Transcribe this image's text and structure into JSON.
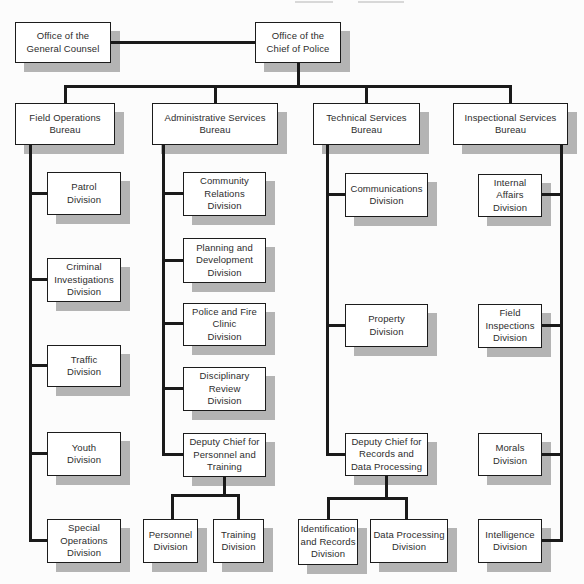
{
  "diagram": {
    "type": "org-chart",
    "colors": {
      "background": "#fcfcfc",
      "box_fill": "#ffffff",
      "box_border": "#1c1c1c",
      "box_shadow": "#b4b4b4",
      "connector_line": "#1a1a1a",
      "text": "#2d2d2d"
    },
    "nodes": [
      {
        "id": "general-counsel",
        "label": "Office of the\nGeneral Counsel",
        "x": 15,
        "y": 22,
        "w": 96,
        "h": 41
      },
      {
        "id": "chief-of-police",
        "label": "Office of the\nChief of Police",
        "x": 255,
        "y": 22,
        "w": 86,
        "h": 41
      },
      {
        "id": "field-operations-bureau",
        "label": "Field Operations\nBureau",
        "x": 15,
        "y": 103,
        "w": 100,
        "h": 42
      },
      {
        "id": "administrative-services-bureau",
        "label": "Administrative Services\nBureau",
        "x": 152,
        "y": 103,
        "w": 126,
        "h": 42
      },
      {
        "id": "technical-services-bureau",
        "label": "Technical Services\nBureau",
        "x": 313,
        "y": 103,
        "w": 107,
        "h": 42
      },
      {
        "id": "inspectional-services-bureau",
        "label": "Inspectional Services\nBureau",
        "x": 453,
        "y": 103,
        "w": 115,
        "h": 42
      },
      {
        "id": "patrol-division",
        "label": "Patrol\nDivision",
        "x": 47,
        "y": 172,
        "w": 74,
        "h": 43
      },
      {
        "id": "criminal-investigations-division",
        "label": "Criminal\nInvestigations\nDivision",
        "x": 47,
        "y": 258,
        "w": 74,
        "h": 44
      },
      {
        "id": "traffic-division",
        "label": "Traffic\nDivision",
        "x": 47,
        "y": 345,
        "w": 74,
        "h": 42
      },
      {
        "id": "youth-division",
        "label": "Youth\nDivision",
        "x": 47,
        "y": 432,
        "w": 74,
        "h": 44
      },
      {
        "id": "special-operations-division",
        "label": "Special\nOperations\nDivision",
        "x": 47,
        "y": 519,
        "w": 74,
        "h": 44
      },
      {
        "id": "community-relations-division",
        "label": "Community\nRelations\nDivision",
        "x": 183,
        "y": 172,
        "w": 83,
        "h": 44
      },
      {
        "id": "planning-development-division",
        "label": "Planning and\nDevelopment\nDivision",
        "x": 183,
        "y": 238,
        "w": 83,
        "h": 45
      },
      {
        "id": "police-fire-clinic-division",
        "label": "Police and Fire\nClinic\nDivision",
        "x": 183,
        "y": 303,
        "w": 83,
        "h": 43
      },
      {
        "id": "disciplinary-review-division",
        "label": "Disciplinary\nReview\nDivision",
        "x": 183,
        "y": 367,
        "w": 83,
        "h": 44
      },
      {
        "id": "deputy-chief-personnel-training",
        "label": "Deputy Chief for\nPersonnel and\nTraining",
        "x": 183,
        "y": 433,
        "w": 83,
        "h": 44
      },
      {
        "id": "personnel-division",
        "label": "Personnel\nDivision",
        "x": 143,
        "y": 519,
        "w": 55,
        "h": 44
      },
      {
        "id": "training-division",
        "label": "Training\nDivision",
        "x": 213,
        "y": 519,
        "w": 51,
        "h": 44
      },
      {
        "id": "communications-division",
        "label": "Communications\nDivision",
        "x": 345,
        "y": 173,
        "w": 83,
        "h": 44
      },
      {
        "id": "property-division",
        "label": "Property\nDivision",
        "x": 345,
        "y": 304,
        "w": 83,
        "h": 43
      },
      {
        "id": "deputy-chief-records-data-processing",
        "label": "Deputy Chief for\nRecords and\nData Processing",
        "x": 345,
        "y": 433,
        "w": 83,
        "h": 43
      },
      {
        "id": "identification-records-division",
        "label": "Identification\nand Records\nDivision",
        "x": 298,
        "y": 519,
        "w": 60,
        "h": 46
      },
      {
        "id": "data-processing-division",
        "label": "Data Processing\nDivision",
        "x": 370,
        "y": 519,
        "w": 78,
        "h": 44
      },
      {
        "id": "internal-affairs-division",
        "label": "Internal\nAffairs\nDivision",
        "x": 478,
        "y": 174,
        "w": 64,
        "h": 43
      },
      {
        "id": "field-inspections-division",
        "label": "Field\nInspections\nDivision",
        "x": 478,
        "y": 304,
        "w": 64,
        "h": 44
      },
      {
        "id": "morals-division",
        "label": "Morals\nDivision",
        "x": 478,
        "y": 433,
        "w": 64,
        "h": 43
      },
      {
        "id": "intelligence-division",
        "label": "Intelligence\nDivision",
        "x": 478,
        "y": 519,
        "w": 64,
        "h": 44
      }
    ],
    "connectors": [
      {
        "x": 111,
        "y": 41,
        "w": 144,
        "h": 3
      },
      {
        "x": 297,
        "y": 62,
        "w": 3,
        "h": 24
      },
      {
        "x": 64,
        "y": 85,
        "w": 448,
        "h": 3
      },
      {
        "x": 64,
        "y": 85,
        "w": 3,
        "h": 18
      },
      {
        "x": 214,
        "y": 85,
        "w": 3,
        "h": 18
      },
      {
        "x": 365,
        "y": 85,
        "w": 3,
        "h": 18
      },
      {
        "x": 509,
        "y": 85,
        "w": 3,
        "h": 18
      },
      {
        "x": 29,
        "y": 144,
        "w": 3,
        "h": 398
      },
      {
        "x": 31,
        "y": 192,
        "w": 16,
        "h": 3
      },
      {
        "x": 31,
        "y": 278,
        "w": 16,
        "h": 3
      },
      {
        "x": 31,
        "y": 364,
        "w": 16,
        "h": 3
      },
      {
        "x": 31,
        "y": 452,
        "w": 16,
        "h": 3
      },
      {
        "x": 31,
        "y": 539,
        "w": 16,
        "h": 3
      },
      {
        "x": 162,
        "y": 144,
        "w": 3,
        "h": 312
      },
      {
        "x": 164,
        "y": 192,
        "w": 19,
        "h": 3
      },
      {
        "x": 164,
        "y": 259,
        "w": 19,
        "h": 3
      },
      {
        "x": 164,
        "y": 322,
        "w": 19,
        "h": 3
      },
      {
        "x": 164,
        "y": 387,
        "w": 19,
        "h": 3
      },
      {
        "x": 164,
        "y": 453,
        "w": 19,
        "h": 3
      },
      {
        "x": 223,
        "y": 477,
        "w": 3,
        "h": 19
      },
      {
        "x": 171,
        "y": 494,
        "w": 69,
        "h": 3
      },
      {
        "x": 171,
        "y": 494,
        "w": 3,
        "h": 25
      },
      {
        "x": 237,
        "y": 494,
        "w": 3,
        "h": 25
      },
      {
        "x": 326,
        "y": 144,
        "w": 3,
        "h": 312
      },
      {
        "x": 328,
        "y": 193,
        "w": 17,
        "h": 3
      },
      {
        "x": 328,
        "y": 324,
        "w": 17,
        "h": 3
      },
      {
        "x": 328,
        "y": 453,
        "w": 17,
        "h": 3
      },
      {
        "x": 385,
        "y": 476,
        "w": 3,
        "h": 23
      },
      {
        "x": 327,
        "y": 497,
        "w": 81,
        "h": 3
      },
      {
        "x": 327,
        "y": 497,
        "w": 3,
        "h": 22
      },
      {
        "x": 405,
        "y": 497,
        "w": 3,
        "h": 22
      },
      {
        "x": 560,
        "y": 144,
        "w": 3,
        "h": 398
      },
      {
        "x": 542,
        "y": 193,
        "w": 18,
        "h": 3
      },
      {
        "x": 542,
        "y": 324,
        "w": 18,
        "h": 3
      },
      {
        "x": 542,
        "y": 453,
        "w": 18,
        "h": 3
      },
      {
        "x": 542,
        "y": 539,
        "w": 18,
        "h": 3
      }
    ],
    "caption_remnants": [
      {
        "x": 295,
        "y": 1,
        "w": 38,
        "h": 2
      },
      {
        "x": 358,
        "y": 1,
        "w": 46,
        "h": 2
      }
    ]
  }
}
